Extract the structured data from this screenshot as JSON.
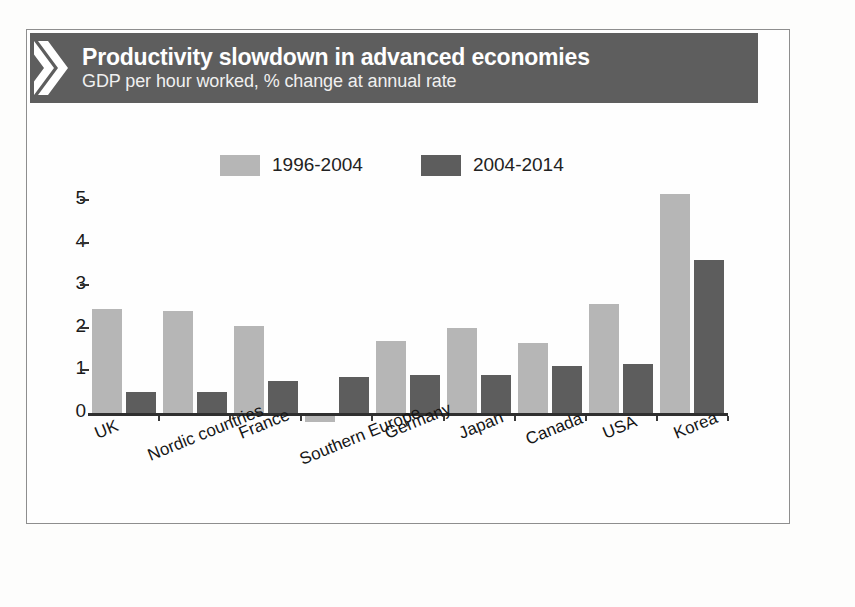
{
  "header": {
    "title": "Productivity slowdown in advanced economies",
    "subtitle": "GDP per hour worked, % change at annual rate",
    "logo_icon": "double-chevron-icon",
    "band_color": "#5e5e5e"
  },
  "colors": {
    "series_1996_2004": "#b6b6b6",
    "series_2004_2014": "#5d5d5d",
    "axis": "#2f2f2f",
    "frame_border": "#8e8e8e",
    "background": "#fefefe"
  },
  "chart_data": {
    "type": "bar",
    "title": "Productivity slowdown in advanced economies",
    "subtitle": "GDP per hour worked, % change at annual rate",
    "xlabel": "",
    "ylabel": "",
    "ylim": [
      -0.3,
      5.5
    ],
    "yticks": [
      0,
      1,
      2,
      3,
      4,
      5
    ],
    "ytick_labels": [
      "0",
      "1",
      "2",
      "3",
      "4",
      "5"
    ],
    "grid": false,
    "legend_position": "top-center",
    "categories": [
      "UK",
      "Nordic countries",
      "France",
      "Southern Europe",
      "Germany",
      "Japan",
      "Canada",
      "USA",
      "Korea"
    ],
    "series": [
      {
        "name": "1996-2004",
        "color": "#b6b6b6",
        "values": [
          2.45,
          2.4,
          2.05,
          -0.15,
          1.7,
          2.0,
          1.65,
          2.55,
          5.15
        ]
      },
      {
        "name": "2004-2014",
        "color": "#5d5d5d",
        "values": [
          0.5,
          0.5,
          0.75,
          0.85,
          0.9,
          0.9,
          1.1,
          1.15,
          3.6
        ]
      }
    ]
  }
}
